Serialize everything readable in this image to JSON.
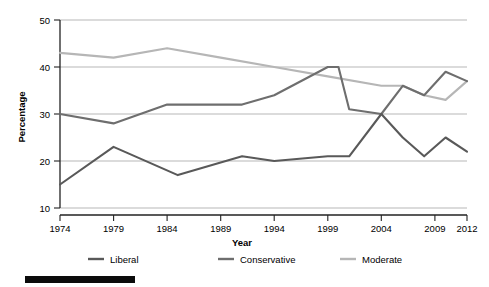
{
  "chart_data": {
    "type": "line",
    "title": "",
    "subtitle": "",
    "xlabel": "Year",
    "ylabel": "Percentage",
    "grid": "horizontal",
    "legend_position": "bottom",
    "xlim": [
      1974,
      2012
    ],
    "ylim": [
      10,
      50
    ],
    "yticks": [
      10,
      20,
      30,
      40,
      50
    ],
    "xticks": [
      1974,
      1979,
      1984,
      1989,
      1994,
      1999,
      2004,
      2009,
      2012
    ],
    "xtick_labels": [
      "1974",
      "1979",
      "1984",
      "1989",
      "1994",
      "1999",
      "2004",
      "2009",
      "2012"
    ],
    "ytick_labels": [
      "10",
      "20",
      "30",
      "40",
      "50"
    ],
    "series": [
      {
        "name": "Liberal",
        "color": "#595959",
        "x": [
          1974,
          1979,
          1985,
          1991,
          1994,
          1999,
          2001,
          2004,
          2006,
          2008,
          2010,
          2012
        ],
        "values": [
          15,
          23,
          17,
          21,
          20,
          21,
          21,
          30,
          25,
          21,
          25,
          22
        ]
      },
      {
        "name": "Conservative",
        "color": "#6e6e6e",
        "x": [
          1974,
          1979,
          1984,
          1991,
          1994,
          1999,
          2000,
          2001,
          2004,
          2006,
          2008,
          2010,
          2012
        ],
        "values": [
          30,
          28,
          32,
          32,
          34,
          40,
          40,
          31,
          30,
          36,
          34,
          39,
          37
        ]
      },
      {
        "name": "Moderate",
        "color": "#b6b6b6",
        "x": [
          1974,
          1979,
          1984,
          1989,
          1994,
          1999,
          2004,
          2006,
          2008,
          2010,
          2012
        ],
        "values": [
          43,
          42,
          44,
          42,
          40,
          38,
          36,
          36,
          34,
          33,
          37
        ]
      }
    ],
    "legend": [
      {
        "label": "Liberal",
        "color": "#595959"
      },
      {
        "label": "Conservative",
        "color": "#6e6e6e"
      },
      {
        "label": "Moderate",
        "color": "#b6b6b6"
      }
    ]
  },
  "axes": {
    "y_title": "Percentage",
    "x_title": "Year"
  },
  "footer": {
    "redaction_bar": ""
  }
}
